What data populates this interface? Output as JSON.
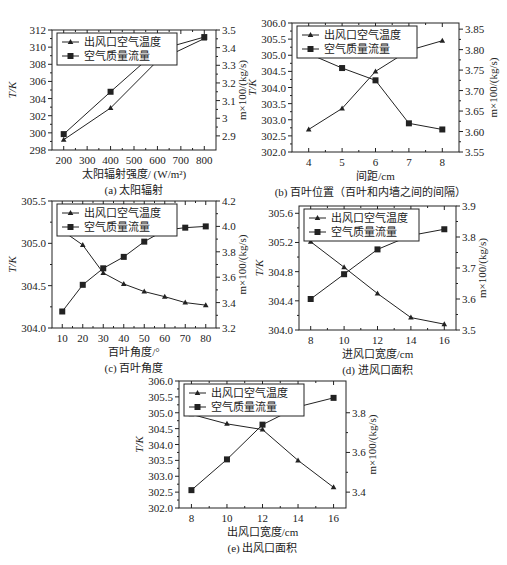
{
  "chart_data": [
    {
      "id": "a",
      "type": "line",
      "caption": "(a) 太阳辐射",
      "xlabel": "太阳辐射强度/ (W/m²)",
      "ylabel_left": "T/K",
      "ylabel_right": "m×100/(kg/s)",
      "x": [
        200,
        400,
        600,
        800
      ],
      "xlim": [
        150,
        850
      ],
      "xticks": [
        200,
        300,
        400,
        500,
        600,
        700,
        800
      ],
      "ylim_left": [
        298,
        312
      ],
      "yticks_left": [
        298,
        300,
        302,
        304,
        306,
        308,
        310,
        312
      ],
      "ylim_right": [
        2.82,
        3.5
      ],
      "yticks_right": [
        2.9,
        3.0,
        3.1,
        3.2,
        3.3,
        3.4,
        3.5
      ],
      "legend": "top-left",
      "series": [
        {
          "name": "出风口空气温度",
          "axis": "left",
          "marker": "triangle",
          "values": [
            299.2,
            302.9,
            308.4,
            311.0
          ]
        },
        {
          "name": "空气质量流量",
          "axis": "right",
          "marker": "square",
          "values": [
            2.91,
            3.15,
            3.385,
            3.46
          ]
        }
      ]
    },
    {
      "id": "b",
      "type": "line",
      "caption": "(b) 百叶位置（百叶和内墙之间的间隔）",
      "xlabel": "间距/cm",
      "ylabel_left": "T/K",
      "ylabel_right": "m×100/(kg/s)",
      "x": [
        4,
        5,
        6,
        7,
        8
      ],
      "xlim": [
        3.5,
        8.5
      ],
      "xticks": [
        4,
        5,
        6,
        7,
        8
      ],
      "ylim_left": [
        302.0,
        306.0
      ],
      "yticks_left": [
        "302.0",
        "302.5",
        "303.0",
        "303.5",
        "304.0",
        "304.5",
        "305.0",
        "305.5",
        "306.0"
      ],
      "ylim_right": [
        3.55,
        3.865
      ],
      "yticks_right": [
        "3.55",
        "3.60",
        "3.65",
        "3.70",
        "3.75",
        "3.80",
        "3.85"
      ],
      "legend": "top-left",
      "series": [
        {
          "name": "出风口空气温度",
          "axis": "left",
          "marker": "triangle",
          "values": [
            302.7,
            303.35,
            304.5,
            305.15,
            305.45
          ]
        },
        {
          "name": "空气质量流量",
          "axis": "right",
          "marker": "square",
          "values": [
            3.79,
            3.755,
            3.725,
            3.62,
            3.605
          ]
        }
      ]
    },
    {
      "id": "c",
      "type": "line",
      "caption": "(c) 百叶角度",
      "xlabel": "百叶角度/°",
      "ylabel_left": "T/K",
      "ylabel_right": "m×100/(kg/s)",
      "x": [
        10,
        20,
        30,
        40,
        50,
        60,
        70,
        80
      ],
      "xlim": [
        5,
        85
      ],
      "xticks": [
        10,
        20,
        30,
        40,
        50,
        60,
        70,
        80
      ],
      "ylim_left": [
        304.0,
        305.5
      ],
      "yticks_left": [
        "304.0",
        "304.5",
        "305.0",
        "305.5"
      ],
      "ylim_right": [
        3.2,
        4.2
      ],
      "yticks_right": [
        "3.2",
        "3.4",
        "3.6",
        "3.8",
        "4.0",
        "4.2"
      ],
      "legend": "top-left",
      "series": [
        {
          "name": "出风口空气温度",
          "axis": "left",
          "marker": "triangle",
          "values": [
            305.15,
            304.98,
            304.65,
            304.52,
            304.43,
            304.37,
            304.3,
            304.27
          ]
        },
        {
          "name": "空气质量流量",
          "axis": "right",
          "marker": "square",
          "values": [
            3.33,
            3.54,
            3.67,
            3.76,
            3.88,
            3.97,
            3.99,
            4.0
          ]
        }
      ]
    },
    {
      "id": "d",
      "type": "line",
      "caption": "(d) 进风口面积",
      "xlabel": "进风口宽度/cm",
      "ylabel_left": "T/K",
      "ylabel_right": "m×100/(kg/s)",
      "x": [
        8,
        10,
        12,
        14,
        16
      ],
      "xlim": [
        7.3,
        16.7
      ],
      "xticks": [
        8,
        10,
        12,
        14,
        16
      ],
      "ylim_left": [
        304.0,
        305.7
      ],
      "yticks_left": [
        "304.0",
        "304.4",
        "304.8",
        "305.2",
        "305.6"
      ],
      "ylim_right": [
        3.5,
        3.9
      ],
      "yticks_right": [
        "3.5",
        "3.6",
        "3.7",
        "3.8",
        "3.9"
      ],
      "legend": "top-left",
      "series": [
        {
          "name": "出风口空气温度",
          "axis": "left",
          "marker": "triangle",
          "values": [
            305.21,
            304.86,
            304.5,
            304.17,
            304.08
          ]
        },
        {
          "name": "空气质量流量",
          "axis": "right",
          "marker": "square",
          "values": [
            3.6,
            3.68,
            3.76,
            3.805,
            3.825
          ]
        }
      ]
    },
    {
      "id": "e",
      "type": "line",
      "caption": "(e) 出风口面积",
      "xlabel": "出风口宽度/cm",
      "ylabel_left": "T/K",
      "ylabel_right": "m×100/(kg/s)",
      "x": [
        8,
        10,
        12,
        14,
        16
      ],
      "xlim": [
        7.3,
        16.7
      ],
      "xticks": [
        8,
        10,
        12,
        14,
        16
      ],
      "ylim_left": [
        302.0,
        306.0
      ],
      "yticks_left": [
        "302.0",
        "302.5",
        "303.0",
        "303.5",
        "304.0",
        "304.5",
        "305.0",
        "305.5",
        "306.0"
      ],
      "ylim_right": [
        3.32,
        3.96
      ],
      "yticks_right": [
        "3.4",
        "3.6",
        "3.8"
      ],
      "legend": "top-left",
      "series": [
        {
          "name": "出风口空气温度",
          "axis": "left",
          "marker": "triangle",
          "values": [
            304.95,
            304.65,
            304.47,
            303.5,
            302.65
          ]
        },
        {
          "name": "空气质量流量",
          "axis": "right",
          "marker": "square",
          "values": [
            3.41,
            3.565,
            3.74,
            3.83,
            3.875
          ]
        }
      ]
    }
  ]
}
